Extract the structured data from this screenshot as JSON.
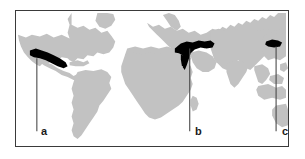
{
  "figure": {
    "type": "world-map-distribution",
    "background_color": "#ffffff",
    "frame_color": "#3a3a3a",
    "land_color": "#c2c2c2",
    "ocean_color": "#ffffff",
    "highlight_color": "#000000",
    "leader_line_color": "#4a4a4a"
  },
  "labels": {
    "a": "a",
    "b": "b",
    "c": "c"
  },
  "markers": [
    {
      "id": "a",
      "label": "a",
      "region_name": "central-america-highlight",
      "marker_x": 36,
      "marker_y": 55,
      "leader_line_x": 36,
      "leader_line_top": 58,
      "leader_line_bottom": 132
    },
    {
      "id": "b",
      "label": "b",
      "region_name": "eastern-mediterranean-anatolia-highlight",
      "marker_x": 190,
      "marker_y": 46,
      "leader_line_x": 190,
      "leader_line_top": 48,
      "leader_line_bottom": 132
    },
    {
      "id": "c",
      "label": "c",
      "region_name": "east-asia-china-highlight",
      "marker_x": 277,
      "marker_y": 44,
      "leader_line_x": 277,
      "leader_line_top": 47,
      "leader_line_bottom": 132
    }
  ]
}
